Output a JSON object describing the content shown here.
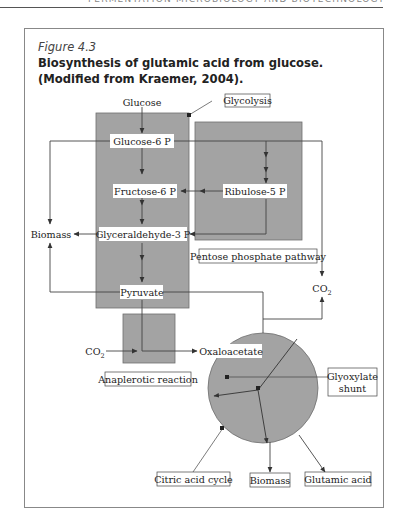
{
  "running_head": "FERMENTATION MICROBIOLOGY AND BIOTECHNOLOGY",
  "figure": {
    "label": "Figure 4.3",
    "caption": "Biosynthesis of glutamic acid from glucose. (Modified from Kraemer, 2004)."
  },
  "diagram": {
    "nodes": {
      "glucose": "Glucose",
      "glucose6p": "Glucose-6 P",
      "fructose6p": "Fructose-6 P",
      "ribulose5p": "Ribulose-5 P",
      "glyceraldehyde3p": "Glyceraldehyde-3 P",
      "pyruvate": "Pyruvate",
      "biomass_left": "Biomass",
      "co2_right": "CO",
      "co2_right_sub": "2",
      "co2_left": "CO",
      "co2_left_sub": "2",
      "oxaloacetate": "Oxaloacetate",
      "biomass_bottom": "Biomass",
      "glutamic_acid": "Glutamic acid"
    },
    "labels": {
      "glycolysis": "Glycolysis",
      "pentose_phosphate": "Pentose phosphate pathway",
      "anaplerotic": "Anaplerotic reaction",
      "glyoxylate_line1": "Glyoxylate",
      "glyoxylate_line2": "shunt",
      "citric_acid_cycle": "Citric acid cycle"
    },
    "colors": {
      "region_fill": "#a3a3a3",
      "region_stroke": "#6e6e6e",
      "line": "#444444"
    }
  }
}
